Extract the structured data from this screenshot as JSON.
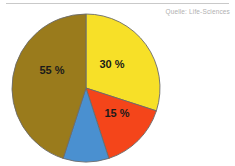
{
  "source_note": "Quelle: Life-Sciences",
  "chart_data": {
    "type": "pie",
    "title": "",
    "xlabel": "",
    "ylabel": "",
    "grid": false,
    "legend": "none",
    "start_angle_deg": 0,
    "direction": "clockwise",
    "center": [
      86,
      88
    ],
    "radius": 74,
    "slices": [
      {
        "name": "yellow-slice",
        "value": 30,
        "label": "30 %",
        "color": "#F7E028",
        "label_pos": [
          112,
          68
        ]
      },
      {
        "name": "red-slice",
        "value": 15,
        "label": "15 %",
        "color": "#F4451A",
        "label_pos": [
          117,
          117
        ]
      },
      {
        "name": "blue-slice",
        "value": 10,
        "label": "",
        "color": "#4A90D0",
        "label_pos": [
          95,
          103
        ]
      },
      {
        "name": "brown-slice",
        "value": 45,
        "label": "55 %",
        "color": "#9A7B1C",
        "label_pos": [
          52,
          74
        ]
      }
    ],
    "outline_color": "#6b6b6b",
    "background": "#ffffff"
  }
}
